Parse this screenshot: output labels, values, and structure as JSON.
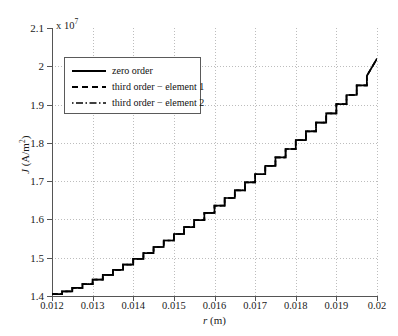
{
  "chart_data": {
    "type": "line",
    "title": "",
    "subtitle": "",
    "xlabel": "r (m)",
    "xlabel_italic": "r",
    "xlabel_unit": "(m)",
    "ylabel": "J (A/m2)",
    "ylabel_italic": "J",
    "ylabel_unit": "(A/m²)",
    "y_exponent_text": "x 10",
    "y_exponent_power": "7",
    "y_scale_factor": 10000000.0,
    "xlim": [
      0.012,
      0.02
    ],
    "ylim": [
      1.4,
      2.1
    ],
    "grid": true,
    "grid_style": "dotted",
    "legend_position": "upper left",
    "xticks": [
      0.012,
      0.013,
      0.014,
      0.015,
      0.016,
      0.017,
      0.018,
      0.019,
      0.02
    ],
    "xticklabels": [
      "0.012",
      "0.013",
      "0.014",
      "0.015",
      "0.016",
      "0.017",
      "0.018",
      "0.019",
      "0.02"
    ],
    "yticks": [
      1.4,
      1.5,
      1.6,
      1.7,
      1.8,
      1.9,
      2.0,
      2.1
    ],
    "yticklabels": [
      "1.4",
      "1.5",
      "1.6",
      "1.7",
      "1.8",
      "1.9",
      "2",
      "2.1"
    ],
    "series": [
      {
        "name": "zero order",
        "style": "solid",
        "color": "#000000",
        "note": "piecewise-constant staircase; overlaps the other two series",
        "x": [
          0.012,
          0.01225,
          0.01225,
          0.0125,
          0.0125,
          0.01275,
          0.01275,
          0.013,
          0.013,
          0.01325,
          0.01325,
          0.0135,
          0.0135,
          0.01375,
          0.01375,
          0.014,
          0.014,
          0.01425,
          0.01425,
          0.0145,
          0.0145,
          0.01475,
          0.01475,
          0.015,
          0.015,
          0.01525,
          0.01525,
          0.0155,
          0.0155,
          0.01575,
          0.01575,
          0.016,
          0.016,
          0.01625,
          0.01625,
          0.0165,
          0.0165,
          0.01675,
          0.01675,
          0.017,
          0.017,
          0.01725,
          0.01725,
          0.0175,
          0.0175,
          0.01775,
          0.01775,
          0.018,
          0.018,
          0.01825,
          0.01825,
          0.0185,
          0.0185,
          0.01875,
          0.01875,
          0.019,
          0.019,
          0.01925,
          0.01925,
          0.0195,
          0.0195,
          0.01975,
          0.01975,
          0.02
        ],
        "y": [
          1.405,
          1.405,
          1.412,
          1.412,
          1.421,
          1.421,
          1.431,
          1.431,
          1.443,
          1.443,
          1.455,
          1.455,
          1.468,
          1.468,
          1.482,
          1.482,
          1.497,
          1.497,
          1.512,
          1.512,
          1.528,
          1.528,
          1.545,
          1.545,
          1.562,
          1.562,
          1.58,
          1.58,
          1.598,
          1.598,
          1.617,
          1.617,
          1.636,
          1.636,
          1.656,
          1.656,
          1.676,
          1.676,
          1.697,
          1.697,
          1.718,
          1.718,
          1.74,
          1.74,
          1.762,
          1.762,
          1.784,
          1.784,
          1.807,
          1.807,
          1.83,
          1.83,
          1.853,
          1.853,
          1.877,
          1.877,
          1.901,
          1.901,
          1.925,
          1.925,
          1.95,
          1.95,
          1.975,
          2.02
        ]
      },
      {
        "name": "third order − element 1",
        "style": "dashed",
        "color": "#000000",
        "note": "coincident with zero order curve"
      },
      {
        "name": "third order − element 2",
        "style": "dashdot",
        "color": "#000000",
        "note": "coincident with zero order curve"
      }
    ],
    "annotations": [],
    "y_start_value": 1.405,
    "y_end_value": 2.02,
    "monotonic": "increasing"
  },
  "legend": {
    "entries": [
      {
        "label": "zero order",
        "style": "solid"
      },
      {
        "label": "third order − element 1",
        "style": "dashed"
      },
      {
        "label": "third order − element 2",
        "style": "dashdot"
      }
    ]
  },
  "colors": {
    "curve": "#000000",
    "axis": "#555555",
    "grid": "#bdbdbd",
    "background": "#ffffff",
    "legend_border": "#5a5a5a",
    "text": "#1a1a1a"
  }
}
